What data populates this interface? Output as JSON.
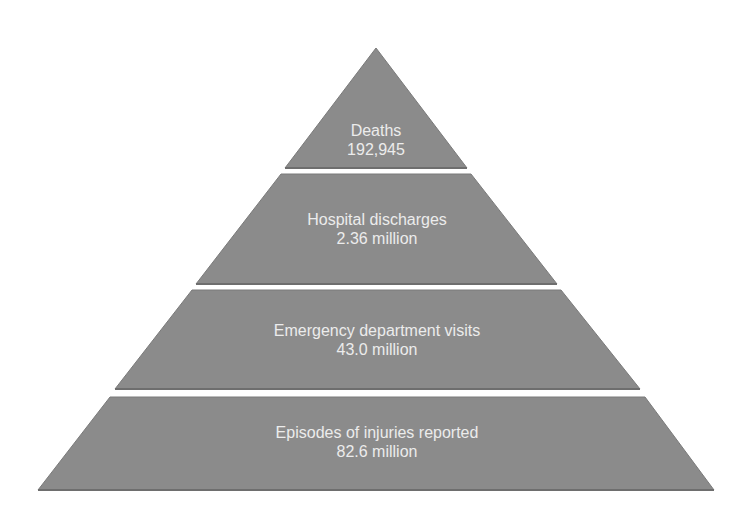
{
  "diagram": {
    "type": "pyramid",
    "colors": {
      "tier_fill": "#8b8b8b",
      "tier_edge": "#6e6e6e",
      "text": "#ececec",
      "background": "#ffffff"
    },
    "tiers": [
      {
        "label": "Deaths",
        "value": "192,945"
      },
      {
        "label": "Hospital discharges",
        "value": "2.36 million"
      },
      {
        "label": "Emergency department visits",
        "value": "43.0 million"
      },
      {
        "label": "Episodes of injuries reported",
        "value": "82.6 million"
      }
    ]
  }
}
